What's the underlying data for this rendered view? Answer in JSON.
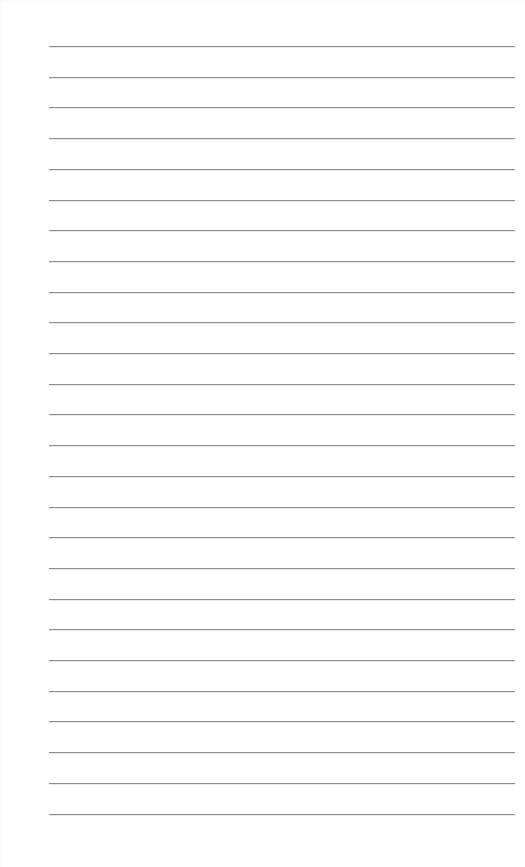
{
  "page": {
    "type": "lined-paper",
    "background_color": "#ffffff",
    "line_color": "#8e8e8e",
    "line_count": 26,
    "line_start_x": 49,
    "line_end_x": 515,
    "first_line_y": 46,
    "line_spacing": 30.7
  }
}
